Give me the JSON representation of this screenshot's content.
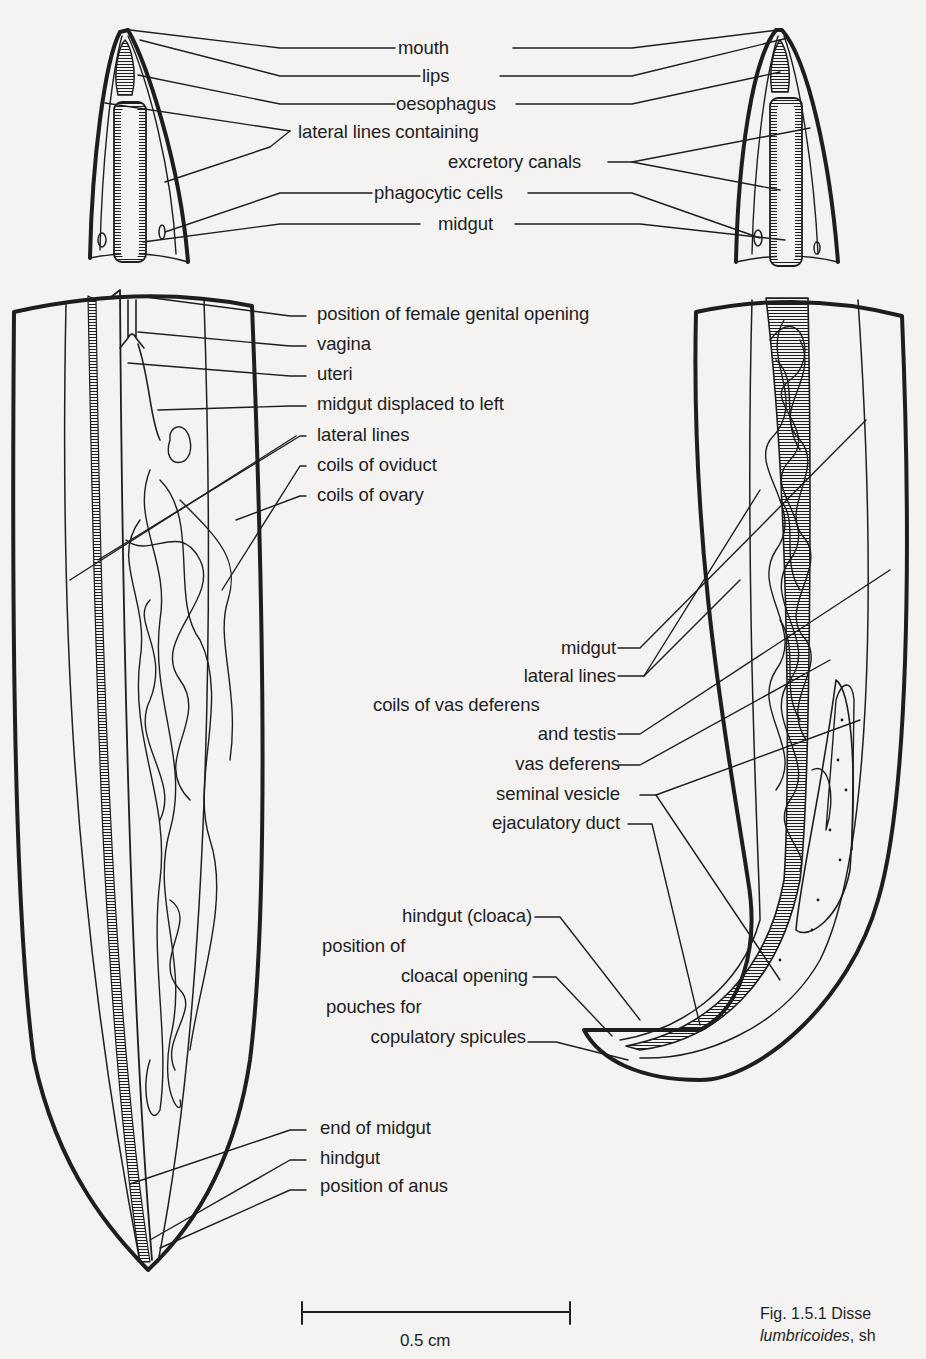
{
  "figure": {
    "caption_line1": "Fig. 1.5.1  Disse",
    "caption_line2_italic": "lumbricoides",
    "caption_line2_rest": ", sh",
    "scale_bar_label": "0.5 cm",
    "colors": {
      "ink": "#1e1e1e",
      "paper": "#f4f3f1"
    }
  },
  "head_labels": {
    "mouth": "mouth",
    "lips": "lips",
    "oesophagus": "oesophagus",
    "lateral_lines": "lateral lines containing",
    "excretory_canals": "excretory canals",
    "phagocytic_cells": "phagocytic cells",
    "midgut": "midgut"
  },
  "female_labels": {
    "genital_opening": "position of female genital opening",
    "vagina": "vagina",
    "uteri": "uteri",
    "midgut_displaced": "midgut displaced to left",
    "lateral_lines": "lateral lines",
    "coils_oviduct": "coils of oviduct",
    "coils_ovary": "coils of ovary",
    "end_midgut": "end of midgut",
    "hindgut": "hindgut",
    "anus": "position of anus"
  },
  "male_labels": {
    "midgut": "midgut",
    "lateral_lines": "lateral lines",
    "coils_vas_1": "coils of vas deferens",
    "coils_vas_2": "and testis",
    "vas_deferens": "vas deferens",
    "seminal_vesicle": "seminal vesicle",
    "ejaculatory_duct": "ejaculatory duct",
    "hindgut_cloaca": "hindgut (cloaca)",
    "cloacal_1": "position of",
    "cloacal_2": "cloacal opening",
    "pouches_1": "pouches for",
    "pouches_2": "copulatory spicules"
  }
}
